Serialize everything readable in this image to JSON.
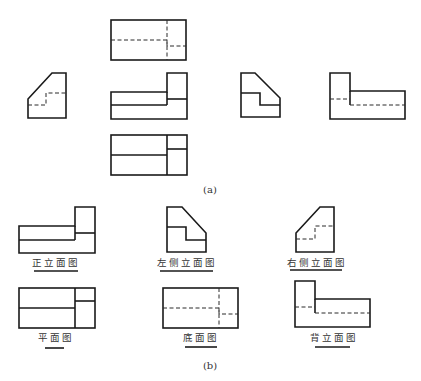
{
  "figure": {
    "part_a": {
      "caption": "(a)",
      "views": [
        {
          "id": "top",
          "position": "top-center"
        },
        {
          "id": "left-profile",
          "position": "middle-left"
        },
        {
          "id": "front",
          "position": "center"
        },
        {
          "id": "right-profile",
          "position": "middle-right"
        },
        {
          "id": "rear",
          "position": "far-right"
        },
        {
          "id": "plan",
          "position": "bottom-center"
        }
      ]
    },
    "part_b": {
      "caption": "(b)",
      "views": [
        {
          "id": "front-elevation",
          "label": "正立面图"
        },
        {
          "id": "left-side-elevation",
          "label": "左侧立面图"
        },
        {
          "id": "right-side-elevation",
          "label": "右侧立面图"
        },
        {
          "id": "plan-view",
          "label": "平面图"
        },
        {
          "id": "bottom-view",
          "label": "底面图"
        },
        {
          "id": "back-elevation",
          "label": "背立面图"
        }
      ]
    },
    "colors": {
      "line": "#1a1a1a",
      "background": "#ffffff"
    }
  }
}
